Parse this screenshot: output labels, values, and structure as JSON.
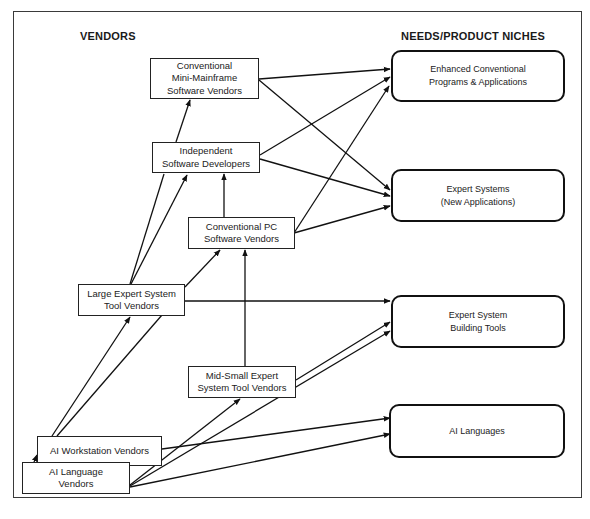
{
  "headings": {
    "vendors": "VENDORS",
    "niches": "NEEDS/PRODUCT NICHES"
  },
  "vendors": {
    "mini_mainframe": {
      "lines": [
        "Conventional",
        "Mini-Mainframe",
        "Software Vendors"
      ]
    },
    "independent": {
      "lines": [
        "Independent",
        "Software Developers"
      ]
    },
    "conventional_pc": {
      "lines": [
        "Conventional PC",
        "Software Vendors"
      ]
    },
    "large_expert": {
      "lines": [
        "Large Expert System",
        "Tool Vendors"
      ]
    },
    "mid_small_expert": {
      "lines": [
        "Mid-Small Expert",
        "System Tool Vendors"
      ]
    },
    "ai_workstation": {
      "lines": [
        "AI Workstation Vendors"
      ]
    },
    "ai_language": {
      "lines": [
        "AI Language",
        "Vendors"
      ]
    }
  },
  "niches": {
    "enhanced": {
      "lines": [
        "Enhanced Conventional",
        "Programs & Applications"
      ]
    },
    "expert_systems": {
      "lines": [
        "Expert Systems",
        "(New Applications)"
      ]
    },
    "building_tools": {
      "lines": [
        "Expert System",
        "Building Tools"
      ]
    },
    "ai_languages": {
      "lines": [
        "AI Languages"
      ]
    }
  },
  "edges": [
    {
      "from": "Conventional Mini-Mainframe Software Vendors",
      "to": "Enhanced Conventional Programs & Applications"
    },
    {
      "from": "Conventional Mini-Mainframe Software Vendors",
      "to": "Expert Systems (New Applications)"
    },
    {
      "from": "Independent Software Developers",
      "to": "Conventional Mini-Mainframe Software Vendors"
    },
    {
      "from": "Independent Software Developers",
      "to": "Enhanced Conventional Programs & Applications"
    },
    {
      "from": "Independent Software Developers",
      "to": "Expert Systems (New Applications)"
    },
    {
      "from": "Conventional PC Software Vendors",
      "to": "Independent Software Developers"
    },
    {
      "from": "Conventional PC Software Vendors",
      "to": "Enhanced Conventional Programs & Applications"
    },
    {
      "from": "Conventional PC Software Vendors",
      "to": "Expert Systems (New Applications)"
    },
    {
      "from": "Large Expert System Tool Vendors",
      "to": "Conventional Mini-Mainframe Software Vendors"
    },
    {
      "from": "Large Expert System Tool Vendors",
      "to": "Independent Software Developers"
    },
    {
      "from": "Large Expert System Tool Vendors",
      "to": "Conventional PC Software Vendors"
    },
    {
      "from": "Large Expert System Tool Vendors",
      "to": "Expert System Building Tools"
    },
    {
      "from": "Mid-Small Expert System Tool Vendors",
      "to": "Conventional PC Software Vendors"
    },
    {
      "from": "Mid-Small Expert System Tool Vendors",
      "to": "Expert System Building Tools"
    },
    {
      "from": "AI Workstation Vendors",
      "to": "Large Expert System Tool Vendors"
    },
    {
      "from": "AI Workstation Vendors",
      "to": "AI Languages"
    },
    {
      "from": "AI Language Vendors",
      "to": "AI Workstation Vendors"
    },
    {
      "from": "AI Language Vendors",
      "to": "Large Expert System Tool Vendors"
    },
    {
      "from": "AI Language Vendors",
      "to": "Mid-Small Expert System Tool Vendors"
    },
    {
      "from": "AI Language Vendors",
      "to": "Expert System Building Tools"
    },
    {
      "from": "AI Language Vendors",
      "to": "AI Languages"
    }
  ]
}
